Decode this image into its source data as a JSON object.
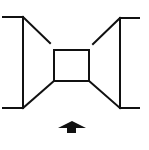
{
  "diagram": {
    "type": "line-drawing",
    "description": "Symmetric bow-tie/hourglass room perspective diagram with a central square and an upward arrow below",
    "stroke_color": "#111111",
    "background_color": "#ffffff",
    "left_panel": {
      "top_stub": {
        "x1": 3,
        "y1": 17,
        "x2": 23,
        "y2": 17
      },
      "bottom_stub": {
        "x1": 3,
        "y1": 108,
        "x2": 23,
        "y2": 108
      },
      "vertical": {
        "x1": 23,
        "y1": 17,
        "x2": 23,
        "y2": 108
      },
      "upper_diagonal": {
        "x1": 23,
        "y1": 17,
        "x2": 50,
        "y2": 43
      },
      "lower_diagonal": {
        "x1": 23,
        "y1": 108,
        "x2": 54,
        "y2": 81
      }
    },
    "right_panel": {
      "top_stub": {
        "x1": 120,
        "y1": 18,
        "x2": 139,
        "y2": 18
      },
      "bottom_stub": {
        "x1": 120,
        "y1": 108,
        "x2": 139,
        "y2": 108
      },
      "vertical": {
        "x1": 120,
        "y1": 18,
        "x2": 120,
        "y2": 108
      },
      "upper_diagonal": {
        "x1": 120,
        "y1": 18,
        "x2": 93,
        "y2": 44
      },
      "lower_diagonal": {
        "x1": 120,
        "y1": 108,
        "x2": 89,
        "y2": 81
      }
    },
    "center_square": {
      "x": 54,
      "y": 50,
      "width": 35,
      "height": 31
    },
    "arrow": {
      "direction": "up",
      "tip": {
        "x": 72,
        "y": 121
      },
      "head_left": {
        "x": 58,
        "y": 128
      },
      "head_right": {
        "x": 86,
        "y": 128
      },
      "stem": {
        "x": 67,
        "y": 127,
        "width": 9,
        "height": 6
      }
    }
  }
}
